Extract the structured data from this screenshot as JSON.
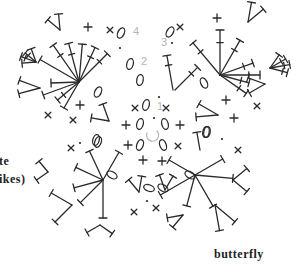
{
  "caption": "butterfly",
  "side_text": {
    "line1": "te",
    "line2": "ikes)"
  },
  "round_labels": [
    {
      "id": "1",
      "x": 157,
      "y": 100
    },
    {
      "id": "2",
      "x": 141,
      "y": 55
    },
    {
      "id": "3",
      "x": 161,
      "y": 36
    },
    {
      "id": "4",
      "x": 133,
      "y": 25
    }
  ],
  "symbols": {
    "chain": "oval",
    "single_crochet": "cross",
    "double_crochet": "T-stem",
    "treble": "T-stem with bar",
    "slip_stitch": "dot",
    "magic_ring": "circle-arrow"
  },
  "colors": {
    "ink": "#2a2a2a",
    "round_number": "#b5b5b5",
    "background": "#ffffff"
  }
}
